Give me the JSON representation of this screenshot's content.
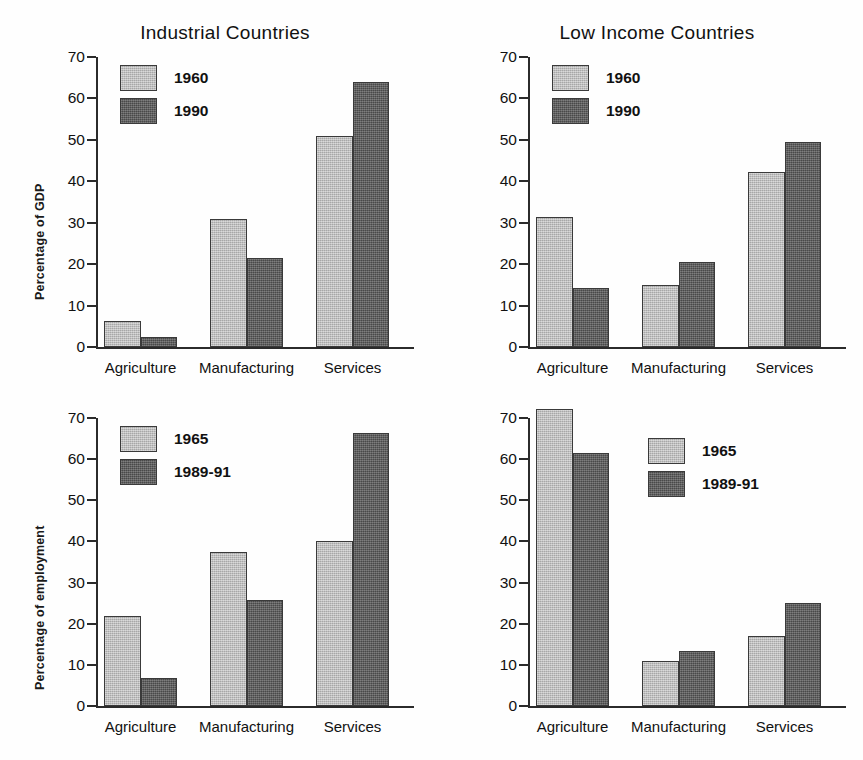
{
  "figure": {
    "width": 863,
    "height": 760,
    "background": "#ffffff",
    "colors": {
      "series_light": "#b9b9b9",
      "series_dark": "#5a5a5a",
      "axis": "#2b2b2b",
      "text": "#111111"
    }
  },
  "chart_data": [
    {
      "id": "industrial-gdp",
      "type": "bar",
      "title": "Industrial Countries",
      "xlabel": "",
      "ylabel": "Percentage of GDP",
      "ylim": [
        0,
        70
      ],
      "yticks": [
        0,
        10,
        20,
        30,
        40,
        50,
        60,
        70
      ],
      "ytick_labels": [
        "0",
        "10",
        "20",
        "30",
        "40",
        "50",
        "60",
        "70"
      ],
      "grid": false,
      "legend_position": "top-left",
      "categories": [
        "Agriculture",
        "Manufacturing",
        "Services"
      ],
      "series": [
        {
          "name": "1960",
          "color": "#b9b9b9",
          "values": [
            6.2,
            30.8,
            51.0
          ]
        },
        {
          "name": "1990",
          "color": "#5a5a5a",
          "values": [
            2.4,
            21.4,
            64.0
          ]
        }
      ]
    },
    {
      "id": "lowincome-gdp",
      "type": "bar",
      "title": "Low Income Countries",
      "xlabel": "",
      "ylabel": "",
      "ylim": [
        0,
        70
      ],
      "yticks": [
        0,
        10,
        20,
        30,
        40,
        50,
        60,
        70
      ],
      "ytick_labels": [
        "0",
        "10",
        "20",
        "30",
        "40",
        "50",
        "60",
        "70"
      ],
      "grid": false,
      "legend_position": "top-left",
      "categories": [
        "Agriculture",
        "Manufacturing",
        "Services"
      ],
      "series": [
        {
          "name": "1960",
          "color": "#b9b9b9",
          "values": [
            31.4,
            15.0,
            42.3
          ]
        },
        {
          "name": "1990",
          "color": "#5a5a5a",
          "values": [
            14.3,
            20.5,
            49.5
          ]
        }
      ]
    },
    {
      "id": "industrial-employment",
      "type": "bar",
      "title": "",
      "xlabel": "",
      "ylabel": "Percentage of employment",
      "ylim": [
        0,
        70
      ],
      "yticks": [
        0,
        10,
        20,
        30,
        40,
        50,
        60,
        70
      ],
      "ytick_labels": [
        "0",
        "10",
        "20",
        "30",
        "40",
        "50",
        "60",
        "70"
      ],
      "grid": false,
      "legend_position": "top-left",
      "categories": [
        "Agriculture",
        "Manufacturing",
        "Services"
      ],
      "series": [
        {
          "name": "1965",
          "color": "#b9b9b9",
          "values": [
            21.8,
            37.5,
            40.2
          ]
        },
        {
          "name": "1989-91",
          "color": "#5a5a5a",
          "values": [
            6.8,
            25.7,
            66.4
          ]
        }
      ]
    },
    {
      "id": "lowincome-employment",
      "type": "bar",
      "title": "",
      "xlabel": "",
      "ylabel": "",
      "ylim": [
        0,
        70
      ],
      "yticks": [
        0,
        10,
        20,
        30,
        40,
        50,
        60,
        70
      ],
      "ytick_labels": [
        "0",
        "10",
        "20",
        "30",
        "40",
        "50",
        "60",
        "70"
      ],
      "grid": false,
      "legend_position": "top-center",
      "categories": [
        "Agriculture",
        "Manufacturing",
        "Services"
      ],
      "series": [
        {
          "name": "1965",
          "color": "#b9b9b9",
          "values": [
            72.3,
            61.5
          ]
        },
        {
          "name": "1989-91",
          "color": "#5a5a5a",
          "values": [
            11.0,
            13.3
          ]
        }
      ]
    }
  ]
}
